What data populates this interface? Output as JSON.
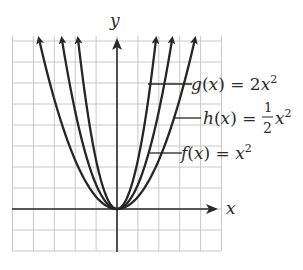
{
  "chart_data": {
    "type": "line",
    "title": "",
    "xlabel": "x",
    "ylabel": "y",
    "xlim": [
      -5,
      5
    ],
    "ylim": [
      -2,
      8
    ],
    "grid": true,
    "series": [
      {
        "name": "g(x) = 2x^2",
        "expr": "2x^2",
        "coef": 2,
        "label": {
          "fn": "g",
          "rhs": "2x",
          "exp": "2"
        },
        "points": [
          [
            -2,
            8
          ],
          [
            -1,
            2
          ],
          [
            0,
            0
          ],
          [
            1,
            2
          ],
          [
            2,
            8
          ]
        ]
      },
      {
        "name": "f(x) = x^2",
        "expr": "x^2",
        "coef": 1,
        "label": {
          "fn": "f",
          "rhs": "x",
          "exp": "2"
        },
        "points": [
          [
            -2.83,
            8
          ],
          [
            -2,
            4
          ],
          [
            -1,
            1
          ],
          [
            0,
            0
          ],
          [
            1,
            1
          ],
          [
            2,
            4
          ],
          [
            2.83,
            8
          ]
        ]
      },
      {
        "name": "h(x) = 1/2 x^2",
        "expr": "(1/2)x^2",
        "coef": 0.5,
        "label": {
          "fn": "h",
          "num": "1",
          "den": "2",
          "rhs": "x",
          "exp": "2"
        },
        "points": [
          [
            -4,
            8
          ],
          [
            -2,
            2
          ],
          [
            0,
            0
          ],
          [
            2,
            2
          ],
          [
            4,
            8
          ]
        ]
      }
    ],
    "annotations": [
      "g(x) = 2x^2",
      "h(x) = 1/2 x^2",
      "f(x) = x^2"
    ]
  },
  "labels": {
    "x_axis": "x",
    "y_axis": "y",
    "g": {
      "pre": "g(x) = 2x",
      "sup": "2"
    },
    "h": {
      "pre": "h(x) = ",
      "num": "1",
      "den": "2",
      "post": "x",
      "sup": "2"
    },
    "f": {
      "pre": "f(x) = x",
      "sup": "2"
    }
  },
  "colors": {
    "grid": "#c8c8c8",
    "axis": "#2a2a2a",
    "curve": "#262626"
  }
}
